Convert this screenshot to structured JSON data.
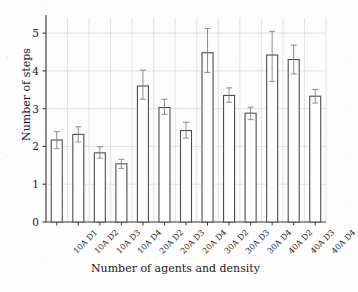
{
  "chart_data": {
    "type": "bar",
    "title": "",
    "xlabel": "Number of agents and density",
    "ylabel": "Number of steps",
    "grid": true,
    "legend": "none",
    "ylim": [
      0,
      5.4
    ],
    "yticks": [
      0,
      1,
      2,
      3,
      4,
      5
    ],
    "ytick_labels": [
      "0",
      "1",
      "2",
      "3",
      "4",
      "5"
    ],
    "categories": [
      "10A D1",
      "10A D2",
      "10A D3",
      "10A D4",
      "20A D2",
      "20A D3",
      "20A D4",
      "30A D2",
      "30A D3",
      "30A D4",
      "40A D2",
      "40A D3",
      "40A D4"
    ],
    "values": [
      2.17,
      2.32,
      1.83,
      1.54,
      3.6,
      3.03,
      2.42,
      4.48,
      3.35,
      2.88,
      4.42,
      4.3,
      3.33
    ],
    "error_low": [
      0.23,
      0.2,
      0.14,
      0.12,
      0.35,
      0.18,
      0.2,
      0.52,
      0.18,
      0.17,
      0.7,
      0.38,
      0.18
    ],
    "error_high": [
      0.22,
      0.2,
      0.16,
      0.12,
      0.42,
      0.22,
      0.22,
      0.64,
      0.2,
      0.16,
      0.62,
      0.38,
      0.18
    ],
    "bar_facecolor": "#ffffff",
    "bar_edgecolor": "#4d4d4d",
    "error_color": "#808080",
    "grid_color": "#d9d9d9",
    "axis_color": "#3a3a3a"
  }
}
